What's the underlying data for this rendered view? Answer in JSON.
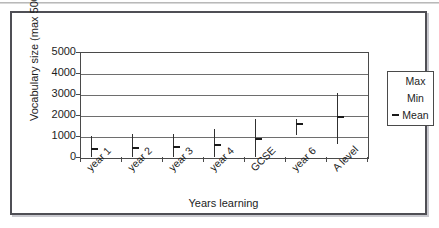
{
  "figure": {
    "frame_border_color": "#4f4f55",
    "background_color": "#ffffff"
  },
  "chart_data": {
    "type": "scatter",
    "title": "",
    "subtitle": "",
    "xlabel": "Years learning",
    "ylabel": "Vocabulary size (max 5000)",
    "categories": [
      "year 1",
      "year 2",
      "year 3",
      "year 4",
      "GCSE",
      "year 6",
      "A level"
    ],
    "ylim": [
      0,
      5000
    ],
    "yticks": [
      0,
      1000,
      2000,
      3000,
      4000,
      5000
    ],
    "ytick_labels": [
      "0",
      "1000",
      "2000",
      "3000",
      "4000",
      "5000"
    ],
    "grid": true,
    "grid_axis": "y",
    "legend_position": "right",
    "series": [
      {
        "name": "Max",
        "values": [
          1000,
          1080,
          1100,
          1320,
          1790,
          1800,
          3050
        ]
      },
      {
        "name": "Min",
        "values": [
          0,
          0,
          0,
          0,
          0,
          1050,
          600
        ]
      },
      {
        "name": "Mean",
        "values": [
          370,
          450,
          480,
          580,
          870,
          1550,
          1900
        ]
      }
    ],
    "mean_marker": "dash",
    "line_color": "#303030",
    "marker_color": "#1a1a1a"
  },
  "legend": {
    "items": [
      {
        "label": "Max",
        "marker": "none"
      },
      {
        "label": "Min",
        "marker": "none"
      },
      {
        "label": "Mean",
        "marker": "dash"
      }
    ]
  },
  "axes": {
    "y_title": "Vocabulary size (max 5000)",
    "x_title": "Years learning"
  }
}
